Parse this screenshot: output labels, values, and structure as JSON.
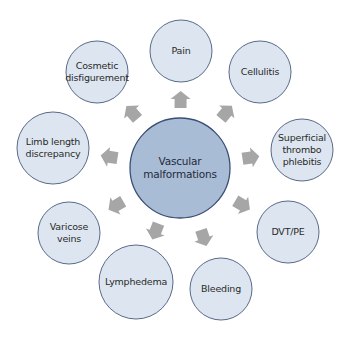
{
  "colors": {
    "center_fill": "#a9bcd6",
    "center_stroke": "#3b4e74",
    "node_fill": "#dde6f0",
    "node_stroke": "#5a6a88",
    "arrow": "#a6a6a6"
  },
  "center": {
    "label": "Vascular\nmalformations",
    "cx": 180,
    "cy": 168,
    "r": 50
  },
  "nodes": [
    {
      "id": "pain",
      "label": "Pain",
      "cx": 181,
      "cy": 51,
      "r": 31
    },
    {
      "id": "cellulitis",
      "label": "Cellulitis",
      "cx": 260,
      "cy": 72,
      "r": 31
    },
    {
      "id": "superficial-thrombophlebitis",
      "label": "Superficial\nthrombo\nphlebitis",
      "cx": 302,
      "cy": 150,
      "r": 31
    },
    {
      "id": "dvt-pe",
      "label": "DVT/PE",
      "cx": 288,
      "cy": 232,
      "r": 31
    },
    {
      "id": "bleeding",
      "label": "Bleeding",
      "cx": 221,
      "cy": 289,
      "r": 31
    },
    {
      "id": "lymphedema",
      "label": "Lymphedema",
      "cx": 136,
      "cy": 282,
      "r": 37
    },
    {
      "id": "varicose-veins",
      "label": "Varicose\nveins",
      "cx": 69,
      "cy": 233,
      "r": 31
    },
    {
      "id": "limb-length-discrepancy",
      "label": "Limb length\ndiscrepancy",
      "cx": 53,
      "cy": 148,
      "r": 36
    },
    {
      "id": "cosmetic-disfigurement",
      "label": "Cosmetic\ndisfigurement",
      "cx": 97,
      "cy": 72,
      "r": 31
    }
  ]
}
